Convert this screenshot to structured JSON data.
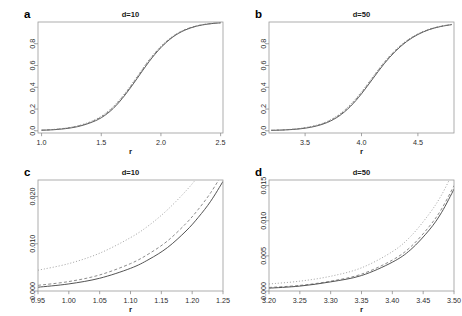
{
  "figure": {
    "background": "#ffffff",
    "axis_color": "#8d8d8d",
    "panels": [
      {
        "letter": "a",
        "title": "d=10",
        "xlabel": "r",
        "ylabel": "",
        "xlim": [
          0.97,
          2.52
        ],
        "ylim": [
          -0.02,
          1.0
        ],
        "xticks": [
          "1.0",
          "1.5",
          "2.0",
          "2.5"
        ],
        "xtickvals": [
          1.0,
          1.5,
          2.0,
          2.5
        ],
        "yticks": [
          "0.0",
          "0.2",
          "0.4",
          "0.6",
          "0.8"
        ],
        "ytickvals": [
          0.0,
          0.2,
          0.4,
          0.6,
          0.8
        ]
      },
      {
        "letter": "b",
        "title": "d=50",
        "xlabel": "r",
        "ylabel": "",
        "xlim": [
          3.18,
          4.82
        ],
        "ylim": [
          -0.02,
          1.0
        ],
        "xticks": [
          "3.5",
          "4.0",
          "4.5"
        ],
        "xtickvals": [
          3.5,
          4.0,
          4.5
        ],
        "yticks": [
          "0.0",
          "0.2",
          "0.4",
          "0.6",
          "0.8"
        ],
        "ytickvals": [
          0.0,
          0.2,
          0.4,
          0.6,
          0.8
        ]
      },
      {
        "letter": "c",
        "title": "d=10",
        "xlabel": "r",
        "ylabel": "",
        "xlim": [
          0.95,
          1.25
        ],
        "ylim": [
          0.0,
          0.0235
        ],
        "xticks": [
          "0.95",
          "1.00",
          "1.05",
          "1.10",
          "1.15",
          "1.20",
          "1.25"
        ],
        "xtickvals": [
          0.95,
          1.0,
          1.05,
          1.1,
          1.15,
          1.2,
          1.25
        ],
        "yticks": [
          "0.000",
          "0.010",
          "0.020"
        ],
        "ytickvals": [
          0.0,
          0.01,
          0.02
        ]
      },
      {
        "letter": "d",
        "title": "d=50",
        "xlabel": "r",
        "ylabel": "",
        "xlim": [
          3.2,
          3.5
        ],
        "ylim": [
          0.0,
          0.0158
        ],
        "xticks": [
          "3.20",
          "3.25",
          "3.30",
          "3.35",
          "3.40",
          "3.45",
          "3.50"
        ],
        "xtickvals": [
          3.2,
          3.25,
          3.3,
          3.35,
          3.4,
          3.45,
          3.5
        ],
        "yticks": [
          "0.000",
          "0.005",
          "0.010",
          "0.015"
        ],
        "ytickvals": [
          0.0,
          0.005,
          0.01,
          0.015
        ]
      }
    ]
  },
  "chart_data": [
    {
      "panel": "a",
      "type": "line",
      "title": "d=10",
      "xlabel": "r",
      "ylabel": "",
      "xlim": [
        0.97,
        2.52
      ],
      "ylim": [
        -0.02,
        1.0
      ],
      "grid": false,
      "legend": "none",
      "series": [
        {
          "name": "curve-1",
          "style": "solid",
          "color": "#555555",
          "x": [
            1.0,
            1.1,
            1.2,
            1.3,
            1.4,
            1.5,
            1.6,
            1.7,
            1.8,
            1.9,
            2.0,
            2.1,
            2.2,
            2.3,
            2.4,
            2.5
          ],
          "y": [
            0.005,
            0.01,
            0.02,
            0.038,
            0.07,
            0.12,
            0.205,
            0.33,
            0.48,
            0.635,
            0.765,
            0.862,
            0.925,
            0.962,
            0.982,
            0.993
          ]
        },
        {
          "name": "curve-2",
          "style": "dashed",
          "color": "#6e6e6e",
          "x": [
            1.0,
            1.1,
            1.2,
            1.3,
            1.4,
            1.5,
            1.6,
            1.7,
            1.8,
            1.9,
            2.0,
            2.1,
            2.2,
            2.3,
            2.4,
            2.5
          ],
          "y": [
            0.006,
            0.012,
            0.023,
            0.042,
            0.075,
            0.128,
            0.215,
            0.34,
            0.49,
            0.645,
            0.772,
            0.866,
            0.928,
            0.964,
            0.983,
            0.993
          ]
        },
        {
          "name": "curve-3",
          "style": "dotted",
          "color": "#808080",
          "x": [
            1.0,
            1.1,
            1.2,
            1.3,
            1.4,
            1.5,
            1.6,
            1.7,
            1.8,
            1.9,
            2.0,
            2.1,
            2.2,
            2.3,
            2.4,
            2.5
          ],
          "y": [
            0.007,
            0.013,
            0.025,
            0.045,
            0.08,
            0.134,
            0.222,
            0.348,
            0.498,
            0.652,
            0.777,
            0.87,
            0.93,
            0.965,
            0.984,
            0.994
          ]
        }
      ]
    },
    {
      "panel": "b",
      "type": "line",
      "title": "d=50",
      "xlabel": "r",
      "ylabel": "",
      "xlim": [
        3.18,
        4.82
      ],
      "ylim": [
        -0.02,
        1.0
      ],
      "grid": false,
      "legend": "none",
      "series": [
        {
          "name": "curve-1",
          "style": "solid",
          "color": "#555555",
          "x": [
            3.2,
            3.3,
            3.4,
            3.5,
            3.6,
            3.7,
            3.8,
            3.9,
            4.0,
            4.1,
            4.2,
            4.3,
            4.4,
            4.5,
            4.6,
            4.7,
            4.8
          ],
          "y": [
            0.004,
            0.007,
            0.013,
            0.024,
            0.044,
            0.078,
            0.135,
            0.222,
            0.34,
            0.478,
            0.615,
            0.73,
            0.82,
            0.885,
            0.93,
            0.958,
            0.976
          ]
        },
        {
          "name": "curve-2",
          "style": "dashed",
          "color": "#6e6e6e",
          "x": [
            3.2,
            3.3,
            3.4,
            3.5,
            3.6,
            3.7,
            3.8,
            3.9,
            4.0,
            4.1,
            4.2,
            4.3,
            4.4,
            4.5,
            4.6,
            4.7,
            4.8
          ],
          "y": [
            0.005,
            0.008,
            0.015,
            0.027,
            0.048,
            0.084,
            0.143,
            0.232,
            0.35,
            0.488,
            0.624,
            0.737,
            0.825,
            0.888,
            0.932,
            0.959,
            0.977
          ]
        },
        {
          "name": "curve-3",
          "style": "dotted",
          "color": "#808080",
          "x": [
            3.2,
            3.3,
            3.4,
            3.5,
            3.6,
            3.7,
            3.8,
            3.9,
            4.0,
            4.1,
            4.2,
            4.3,
            4.4,
            4.5,
            4.6,
            4.7,
            4.8
          ],
          "y": [
            0.005,
            0.009,
            0.016,
            0.029,
            0.051,
            0.088,
            0.149,
            0.24,
            0.358,
            0.495,
            0.63,
            0.742,
            0.829,
            0.891,
            0.934,
            0.961,
            0.978
          ]
        }
      ]
    },
    {
      "panel": "c",
      "type": "line",
      "title": "d=10",
      "xlabel": "r",
      "ylabel": "",
      "xlim": [
        0.95,
        1.25
      ],
      "ylim": [
        0.0,
        0.0235
      ],
      "grid": false,
      "legend": "none",
      "series": [
        {
          "name": "curve-upper",
          "style": "dotted",
          "color": "#9a9a9a",
          "x": [
            0.95,
            1.0,
            1.05,
            1.1,
            1.13,
            1.16,
            1.19,
            1.21,
            1.23,
            1.25
          ],
          "y": [
            0.0044,
            0.0058,
            0.008,
            0.0113,
            0.0139,
            0.0172,
            0.0212,
            0.0243,
            0.0278,
            0.0318
          ]
        },
        {
          "name": "curve-middle",
          "style": "dashed",
          "color": "#777777",
          "x": [
            0.95,
            1.0,
            1.05,
            1.1,
            1.13,
            1.16,
            1.19,
            1.21,
            1.23,
            1.25
          ],
          "y": [
            0.0012,
            0.002,
            0.0034,
            0.0058,
            0.0079,
            0.0106,
            0.0143,
            0.0173,
            0.0208,
            0.025
          ]
        },
        {
          "name": "curve-lower",
          "style": "solid",
          "color": "#4a4a4a",
          "x": [
            0.95,
            1.0,
            1.05,
            1.1,
            1.13,
            1.16,
            1.19,
            1.21,
            1.23,
            1.25
          ],
          "y": [
            0.0008,
            0.0015,
            0.0027,
            0.0048,
            0.0067,
            0.0092,
            0.0127,
            0.0156,
            0.019,
            0.0232
          ]
        }
      ]
    },
    {
      "panel": "d",
      "type": "line",
      "title": "d=50",
      "xlabel": "r",
      "ylabel": "",
      "xlim": [
        3.2,
        3.5
      ],
      "ylim": [
        0.0,
        0.0158
      ],
      "grid": false,
      "legend": "none",
      "series": [
        {
          "name": "curve-upper",
          "style": "dotted",
          "color": "#9a9a9a",
          "x": [
            3.2,
            3.25,
            3.3,
            3.35,
            3.4,
            3.43,
            3.46,
            3.48,
            3.5
          ],
          "y": [
            0.001,
            0.0014,
            0.0021,
            0.0033,
            0.0056,
            0.0078,
            0.011,
            0.0137,
            0.0172
          ]
        },
        {
          "name": "curve-middle",
          "style": "dashed",
          "color": "#777777",
          "x": [
            3.2,
            3.25,
            3.3,
            3.35,
            3.4,
            3.43,
            3.46,
            3.48,
            3.5
          ],
          "y": [
            0.0005,
            0.0008,
            0.0014,
            0.0024,
            0.0044,
            0.0063,
            0.0092,
            0.0117,
            0.015
          ]
        },
        {
          "name": "curve-lower",
          "style": "solid",
          "color": "#4a4a4a",
          "x": [
            3.2,
            3.25,
            3.3,
            3.35,
            3.4,
            3.43,
            3.46,
            3.48,
            3.5
          ],
          "y": [
            0.0004,
            0.0007,
            0.0013,
            0.0022,
            0.0041,
            0.0059,
            0.0087,
            0.0112,
            0.0145
          ]
        }
      ]
    }
  ]
}
